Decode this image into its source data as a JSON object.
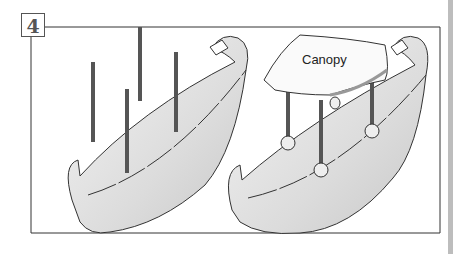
{
  "figure": {
    "step_number": "4",
    "left_panel": {
      "description": "boat hull with four upright poles"
    },
    "right_panel": {
      "description": "boat hull with canopy mounted on four poles",
      "label": "Canopy"
    }
  },
  "colors": {
    "outline": "#333333",
    "pole": "#555555",
    "hull_shade": "#d9d9d9",
    "edge_bar": "#bdbdbd"
  }
}
